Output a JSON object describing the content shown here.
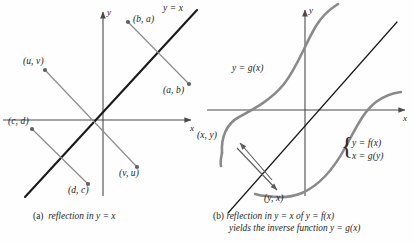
{
  "figure": {
    "background": "#fefefe",
    "axis_color": "#4a4a4a",
    "line_color": "#1a1a1a",
    "curve_color": "#7a7a7a",
    "point_color": "#666666",
    "text_color": "#232323"
  },
  "panel_a": {
    "axis_x_label": "x",
    "axis_y_label": "y",
    "line_label": "y = x",
    "points": [
      {
        "label": "(b, a)",
        "x": 128,
        "y": 22
      },
      {
        "label": "(a, b)",
        "x": 190,
        "y": 85
      },
      {
        "label": "(u, v)",
        "x": 45,
        "y": 70
      },
      {
        "label": "(v, u)",
        "x": 138,
        "y": 168
      },
      {
        "label": "(c, d)",
        "x": 32,
        "y": 128
      },
      {
        "label": "(d, c)",
        "x": 89,
        "y": 185
      }
    ],
    "caption_prefix": "(a)",
    "caption_text": "reflection in y = x"
  },
  "panel_b": {
    "axis_x_label": "x",
    "axis_y_label": "y",
    "curve_label_g": "y = g(x)",
    "system_line_1": "y = f(x)",
    "system_line_2": "x = g(y)",
    "point_label_xy": "(x, y)",
    "point_label_yx": "(y, x)",
    "caption_prefix": "(b)",
    "caption_line_1": "reflection in y = x of y = f(x)",
    "caption_line_2": "yields the inverse function y = g(x)"
  },
  "chart_data": {
    "type": "line",
    "panels": [
      {
        "id": "a",
        "caption": "(a) reflection in y = x",
        "origin_px": [
          103,
          120
        ],
        "series": [
          {
            "name": "y = x",
            "type": "line",
            "style": "thick-black",
            "endpoints_px": [
              [
                25,
                243
              ],
              [
                196,
                8
              ]
            ]
          },
          {
            "name": "reflection-segment-ba-ab",
            "type": "segment",
            "style": "thin-gray",
            "from_label": "(b, a)",
            "to_label": "(a, b)",
            "endpoints_px": [
              [
                128,
                22
              ],
              [
                190,
                85
              ]
            ]
          },
          {
            "name": "reflection-segment-uv-vu",
            "type": "segment",
            "style": "thin-gray",
            "from_label": "(u, v)",
            "to_label": "(v, u)",
            "endpoints_px": [
              [
                45,
                70
              ],
              [
                138,
                168
              ]
            ]
          },
          {
            "name": "reflection-segment-cd-dc",
            "type": "segment",
            "style": "thin-gray",
            "from_label": "(c, d)",
            "to_label": "(d, c)",
            "endpoints_px": [
              [
                32,
                128
              ],
              [
                89,
                185
              ]
            ]
          }
        ],
        "xlabel": "x",
        "ylabel": "y",
        "grid": false,
        "legend": "none"
      },
      {
        "id": "b",
        "caption": "(b) reflection in y = x of y = f(x) yields the inverse function y = g(x)",
        "origin_px": [
          305,
          110
        ],
        "series": [
          {
            "name": "y = f(x)",
            "type": "curve",
            "style": "thick-gray",
            "shape": "S-curve-right"
          },
          {
            "name": "y = g(x)",
            "type": "curve",
            "style": "thick-gray",
            "shape": "S-curve-left"
          },
          {
            "name": "y = x",
            "type": "line",
            "style": "thin-black",
            "endpoints_px": [
              [
                228,
                212
              ],
              [
                395,
                22
              ]
            ]
          }
        ],
        "annotations": [
          {
            "label": "(x, y)",
            "at_px": [
              225,
              138
            ]
          },
          {
            "label": "(y, x)",
            "at_px": [
              281,
              198
            ]
          },
          {
            "label": "y = g(x)",
            "at_px": [
              238,
              68
            ]
          },
          {
            "label": "y = f(x)",
            "at_px": [
              352,
              146
            ]
          },
          {
            "label": "x = g(y)",
            "at_px": [
              352,
              158
            ]
          }
        ],
        "xlabel": "x",
        "ylabel": "y",
        "grid": false,
        "legend": "none"
      }
    ]
  }
}
